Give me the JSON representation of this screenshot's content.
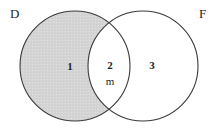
{
  "figure": {
    "kind": "venn-diagram",
    "background_color": "#ffffff",
    "stroke_color": "#333333",
    "shade_color": "#d5d5d5"
  },
  "sets": {
    "left": {
      "label": "D",
      "cx": 75,
      "cy": 66,
      "r": 55,
      "shaded": true
    },
    "right": {
      "label": "F",
      "cx": 143,
      "cy": 66,
      "r": 55,
      "shaded": false
    }
  },
  "regions": [
    {
      "name": "left-only",
      "label": "1",
      "shaded": true
    },
    {
      "name": "intersection",
      "label": "2",
      "shaded": false
    },
    {
      "name": "intersection-sub",
      "label": "m",
      "shaded": false
    },
    {
      "name": "right-only",
      "label": "3",
      "shaded": false
    }
  ]
}
